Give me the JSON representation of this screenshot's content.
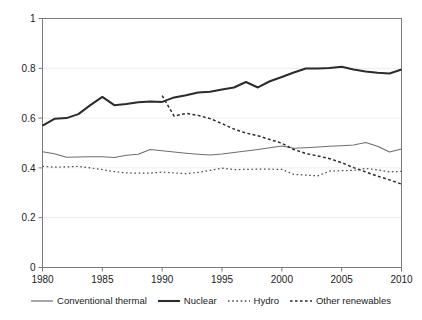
{
  "chart_data": {
    "type": "line",
    "title": "",
    "xlabel": "",
    "ylabel": "",
    "xlim": [
      1980,
      2010
    ],
    "ylim": [
      0,
      1
    ],
    "grid": true,
    "grid_axis": "y",
    "legend_position": "bottom",
    "x_ticks": [
      "1980",
      "1985",
      "1990",
      "1995",
      "2000",
      "2005",
      "2010"
    ],
    "x_tick_values": [
      1980,
      1985,
      1990,
      1995,
      2000,
      2005,
      2010
    ],
    "y_ticks": [
      "0",
      "0.2",
      "0.4",
      "0.6",
      "0.8",
      "1"
    ],
    "y_tick_values": [
      0,
      0.2,
      0.4,
      0.6,
      0.8,
      1
    ],
    "x": [
      1980,
      1981,
      1982,
      1983,
      1984,
      1985,
      1986,
      1987,
      1988,
      1989,
      1990,
      1991,
      1992,
      1993,
      1994,
      1995,
      1996,
      1997,
      1998,
      1999,
      2000,
      2001,
      2002,
      2003,
      2004,
      2005,
      2006,
      2007,
      2008,
      2009,
      2010
    ],
    "series": [
      {
        "name": "Conventional thermal",
        "style": "solid",
        "color": "#6e6e6e",
        "width": 1.1,
        "values": [
          0.465,
          0.457,
          0.443,
          0.444,
          0.445,
          0.445,
          0.442,
          0.451,
          0.455,
          0.474,
          0.469,
          0.464,
          0.459,
          0.455,
          0.452,
          0.456,
          0.462,
          0.468,
          0.474,
          0.481,
          0.488,
          0.479,
          0.481,
          0.484,
          0.487,
          0.489,
          0.492,
          0.502,
          0.487,
          0.464,
          0.476
        ]
      },
      {
        "name": "Nuclear",
        "style": "solid",
        "color": "#2b2b2b",
        "width": 2.0,
        "values": [
          0.57,
          0.597,
          0.6,
          0.616,
          0.652,
          0.685,
          0.652,
          0.657,
          0.664,
          0.667,
          0.665,
          0.683,
          0.692,
          0.703,
          0.706,
          0.715,
          0.723,
          0.745,
          0.723,
          0.748,
          0.765,
          0.783,
          0.799,
          0.799,
          0.801,
          0.806,
          0.795,
          0.787,
          0.782,
          0.779,
          0.795
        ]
      },
      {
        "name": "Hydro",
        "style": "dotted",
        "color": "#4a4a4a",
        "width": 1.2,
        "values": [
          0.406,
          0.403,
          0.404,
          0.406,
          0.4,
          0.393,
          0.385,
          0.38,
          0.379,
          0.379,
          0.383,
          0.38,
          0.377,
          0.382,
          0.39,
          0.399,
          0.393,
          0.394,
          0.395,
          0.395,
          0.394,
          0.374,
          0.371,
          0.368,
          0.387,
          0.389,
          0.39,
          0.398,
          0.392,
          0.384,
          0.386
        ]
      },
      {
        "name": "Other renewables",
        "style": "dashed",
        "color": "#2b2b2b",
        "width": 1.5,
        "start_year": 1990,
        "values": [
          null,
          null,
          null,
          null,
          null,
          null,
          null,
          null,
          null,
          null,
          0.69,
          0.608,
          0.619,
          0.611,
          0.598,
          0.578,
          0.556,
          0.54,
          0.529,
          0.514,
          0.499,
          0.474,
          0.458,
          0.448,
          0.437,
          0.421,
          0.401,
          0.384,
          0.367,
          0.352,
          0.335
        ]
      }
    ]
  },
  "legend": {
    "items": [
      {
        "label": "Conventional thermal",
        "style": "solid",
        "color": "#6e6e6e"
      },
      {
        "label": "Nuclear",
        "style": "solid",
        "color": "#2b2b2b"
      },
      {
        "label": "Hydro",
        "style": "dotted",
        "color": "#4a4a4a"
      },
      {
        "label": "Other renewables",
        "style": "dashed",
        "color": "#2b2b2b"
      }
    ]
  },
  "axes": {
    "frame_color": "#7a7a7a",
    "grid_color": "#ececec"
  }
}
